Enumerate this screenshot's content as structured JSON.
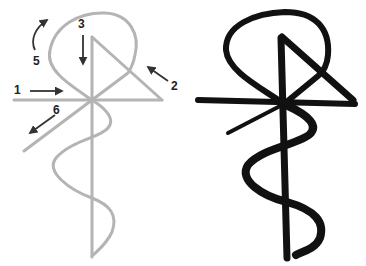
{
  "diagram": {
    "left_panel": {
      "description": "stroke-order guide",
      "stroke_color": "#b4b4b4",
      "arrow_color": "#333333",
      "steps": [
        {
          "number": "1",
          "label_x": 14,
          "label_y": 84
        },
        {
          "number": "2",
          "label_x": 171,
          "label_y": 80
        },
        {
          "number": "3",
          "label_x": 78,
          "label_y": 18
        },
        {
          "number": "5",
          "label_x": 33,
          "label_y": 55
        },
        {
          "number": "6",
          "label_x": 53,
          "label_y": 104
        }
      ]
    },
    "right_panel": {
      "description": "finished symbol",
      "stroke_color": "#111111"
    }
  }
}
